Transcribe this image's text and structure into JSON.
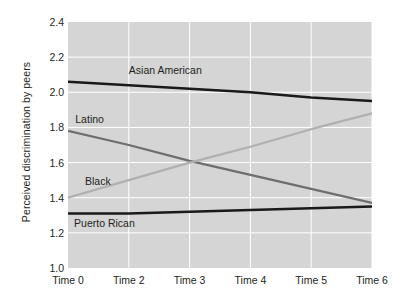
{
  "chart_data": {
    "type": "line",
    "title": "",
    "xlabel": "",
    "ylabel": "Perceived discrimination by peers",
    "categories": [
      "Time 0",
      "Time 2",
      "Time 3",
      "Time 4",
      "Time 5",
      "Time 6"
    ],
    "x": [
      0,
      1,
      2,
      3,
      4,
      5
    ],
    "ylim": [
      1.0,
      2.4
    ],
    "xlim": [
      0,
      5
    ],
    "yticks": [
      "2.4",
      "2.2",
      "2.0",
      "1.8",
      "1.6",
      "1.4",
      "1.2",
      "1.0"
    ],
    "ytick_values": [
      2.4,
      2.2,
      2.0,
      1.8,
      1.6,
      1.4,
      1.2,
      1.0
    ],
    "grid": true,
    "grid_color": "#ffffff",
    "plot_background": "#d5d5d5",
    "legend_position": "inline-labels",
    "series": [
      {
        "name": "Asian American",
        "color": "#1a1a1a",
        "width": 2.6,
        "values": [
          2.06,
          2.04,
          2.02,
          2.0,
          1.97,
          1.95
        ],
        "label_x": 1.0,
        "label_y": 2.12
      },
      {
        "name": "Latino",
        "color": "#6e6e6e",
        "width": 2.2,
        "values": [
          1.78,
          1.7,
          1.61,
          1.53,
          1.45,
          1.37
        ],
        "label_x": 0.12,
        "label_y": 1.84
      },
      {
        "name": "Black",
        "color": "#b0b0b0",
        "width": 2.2,
        "values": [
          1.4,
          1.5,
          1.6,
          1.69,
          1.79,
          1.88
        ],
        "label_x": 0.28,
        "label_y": 1.49
      },
      {
        "name": "Puerto Rican",
        "color": "#1a1a1a",
        "width": 2.6,
        "values": [
          1.31,
          1.31,
          1.32,
          1.33,
          1.34,
          1.35
        ],
        "label_x": 0.1,
        "label_y": 1.25
      }
    ]
  }
}
